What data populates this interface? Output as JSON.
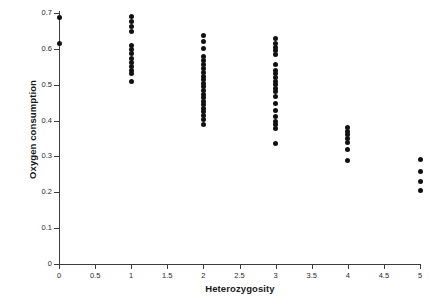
{
  "chart_data": {
    "type": "scatter",
    "title": "",
    "xlabel": "Heterozygosity",
    "ylabel": "Oxygen consumption",
    "xlim": [
      0,
      5
    ],
    "ylim": [
      0,
      0.7
    ],
    "xticks": [
      "0",
      "0.5",
      "1",
      "1.5",
      "2",
      "2.5",
      "3",
      "3.5",
      "4",
      "4.5",
      "5"
    ],
    "xtick_values": [
      0,
      0.5,
      1,
      1.5,
      2,
      2.5,
      3,
      3.5,
      4,
      4.5,
      5
    ],
    "yticks": [
      "0",
      "0.1",
      "0.2",
      "0.3",
      "0.4",
      "0.5",
      "0.6",
      "0.7"
    ],
    "ytick_values": [
      0,
      0.1,
      0.2,
      0.3,
      0.4,
      0.5,
      0.6,
      0.7
    ],
    "grid": false,
    "legend": false,
    "marker": "filled-circle",
    "marker_color": "#111111",
    "axis_color": "#3c3c3c",
    "background_color": "#ffffff",
    "series": [
      {
        "name": "Oxygen consumption vs heterozygosity",
        "points": [
          {
            "x": 0,
            "y": 0.688
          },
          {
            "x": 0,
            "y": 0.616
          },
          {
            "x": 1,
            "y": 0.69
          },
          {
            "x": 1,
            "y": 0.676
          },
          {
            "x": 1,
            "y": 0.662
          },
          {
            "x": 1,
            "y": 0.648
          },
          {
            "x": 1,
            "y": 0.608
          },
          {
            "x": 1,
            "y": 0.598
          },
          {
            "x": 1,
            "y": 0.588
          },
          {
            "x": 1,
            "y": 0.572
          },
          {
            "x": 1,
            "y": 0.562
          },
          {
            "x": 1,
            "y": 0.552
          },
          {
            "x": 1,
            "y": 0.54
          },
          {
            "x": 1,
            "y": 0.53
          },
          {
            "x": 1,
            "y": 0.508
          },
          {
            "x": 2,
            "y": 0.636
          },
          {
            "x": 2,
            "y": 0.62
          },
          {
            "x": 2,
            "y": 0.602
          },
          {
            "x": 2,
            "y": 0.58
          },
          {
            "x": 2,
            "y": 0.568
          },
          {
            "x": 2,
            "y": 0.556
          },
          {
            "x": 2,
            "y": 0.546
          },
          {
            "x": 2,
            "y": 0.534
          },
          {
            "x": 2,
            "y": 0.524
          },
          {
            "x": 2,
            "y": 0.514
          },
          {
            "x": 2,
            "y": 0.504
          },
          {
            "x": 2,
            "y": 0.494
          },
          {
            "x": 2,
            "y": 0.484
          },
          {
            "x": 2,
            "y": 0.474
          },
          {
            "x": 2,
            "y": 0.464
          },
          {
            "x": 2,
            "y": 0.454
          },
          {
            "x": 2,
            "y": 0.444
          },
          {
            "x": 2,
            "y": 0.434
          },
          {
            "x": 2,
            "y": 0.424
          },
          {
            "x": 2,
            "y": 0.414
          },
          {
            "x": 2,
            "y": 0.404
          },
          {
            "x": 2,
            "y": 0.388
          },
          {
            "x": 3,
            "y": 0.628
          },
          {
            "x": 3,
            "y": 0.614
          },
          {
            "x": 3,
            "y": 0.604
          },
          {
            "x": 3,
            "y": 0.594
          },
          {
            "x": 3,
            "y": 0.584
          },
          {
            "x": 3,
            "y": 0.556
          },
          {
            "x": 3,
            "y": 0.54
          },
          {
            "x": 3,
            "y": 0.53
          },
          {
            "x": 3,
            "y": 0.52
          },
          {
            "x": 3,
            "y": 0.51
          },
          {
            "x": 3,
            "y": 0.5
          },
          {
            "x": 3,
            "y": 0.49
          },
          {
            "x": 3,
            "y": 0.48
          },
          {
            "x": 3,
            "y": 0.466
          },
          {
            "x": 3,
            "y": 0.448
          },
          {
            "x": 3,
            "y": 0.428
          },
          {
            "x": 3,
            "y": 0.41
          },
          {
            "x": 3,
            "y": 0.398
          },
          {
            "x": 3,
            "y": 0.388
          },
          {
            "x": 3,
            "y": 0.378
          },
          {
            "x": 3,
            "y": 0.336
          },
          {
            "x": 4,
            "y": 0.38
          },
          {
            "x": 4,
            "y": 0.37
          },
          {
            "x": 4,
            "y": 0.36
          },
          {
            "x": 4,
            "y": 0.35
          },
          {
            "x": 4,
            "y": 0.34
          },
          {
            "x": 4,
            "y": 0.318
          },
          {
            "x": 4,
            "y": 0.288
          },
          {
            "x": 5,
            "y": 0.292
          },
          {
            "x": 5,
            "y": 0.258
          },
          {
            "x": 5,
            "y": 0.23
          },
          {
            "x": 5,
            "y": 0.206
          }
        ]
      }
    ]
  },
  "geometry": {
    "origin_x_px": 59,
    "origin_y_px": 264,
    "x_px_per_unit": 72.2,
    "y_px_per_unit": 358.6
  }
}
